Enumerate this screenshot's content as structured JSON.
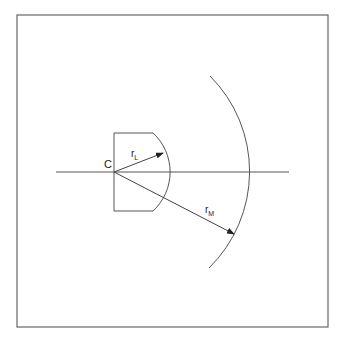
{
  "diagram": {
    "labels": {
      "center": "C",
      "lens_radius": "r",
      "lens_radius_sub": "L",
      "mirror_radius": "r",
      "mirror_radius_sub": "M"
    },
    "colors": {
      "line": "#555555",
      "frame": "#666666",
      "text": "#222222"
    }
  }
}
